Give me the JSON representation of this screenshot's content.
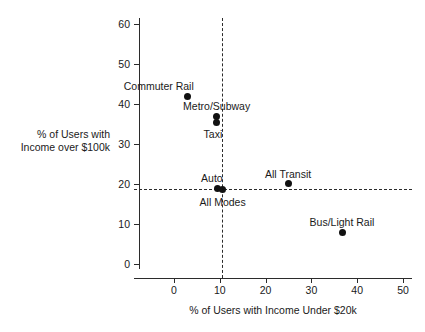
{
  "chart_data": {
    "type": "scatter",
    "title": "",
    "xlabel": "% of Users with Income Under $20k",
    "ylabel": "% of Users with\nIncome over $100k",
    "ylabel_line1": "% of Users with",
    "ylabel_line2": "Income over $100k",
    "xlim": [
      -6,
      51
    ],
    "ylim": [
      -1.5,
      63
    ],
    "xticks": [
      0,
      10,
      20,
      30,
      40,
      50
    ],
    "yticks": [
      0,
      10,
      20,
      30,
      40,
      50,
      60
    ],
    "xtick_labels": [
      "0",
      "10",
      "20",
      "30",
      "40",
      "50"
    ],
    "ytick_labels": [
      "0",
      "10",
      "20",
      "30",
      "40",
      "50",
      "60"
    ],
    "grid": false,
    "legend": "none",
    "points": [
      {
        "name": "Commuter Rail",
        "x": 3.0,
        "y": 42.0,
        "label": "Commuter Rail",
        "label_pos": "above-left"
      },
      {
        "name": "Metro/Subway",
        "x": 9.3,
        "y": 37.0,
        "label": "Metro/Subway",
        "label_pos": "above"
      },
      {
        "name": "Taxi",
        "x": 9.3,
        "y": 35.3,
        "label": "Taxi",
        "label_pos": "below-left"
      },
      {
        "name": "Auto",
        "x": 9.4,
        "y": 19.0,
        "label": "Auto",
        "label_pos": "above-left"
      },
      {
        "name": "All Modes",
        "x": 10.6,
        "y": 18.7,
        "label": "All Modes",
        "label_pos": "below"
      },
      {
        "name": "All Transit",
        "x": 24.9,
        "y": 20.1,
        "label": "All Transit",
        "label_pos": "above"
      },
      {
        "name": "Bus/Light Rail",
        "x": 36.7,
        "y": 8.0,
        "label": "Bus/Light Rail",
        "label_pos": "above"
      }
    ],
    "reference_lines": [
      {
        "name": "vertical-all-modes",
        "orientation": "vertical",
        "value": 10.5,
        "style": "dashed"
      },
      {
        "name": "horizontal-all-modes",
        "orientation": "horizontal",
        "value": 18.7,
        "style": "dashed"
      }
    ],
    "colors": {
      "point": "#111111",
      "axis": "#2b2b2b",
      "text": "#1a1a1a",
      "background": "#ffffff"
    }
  }
}
